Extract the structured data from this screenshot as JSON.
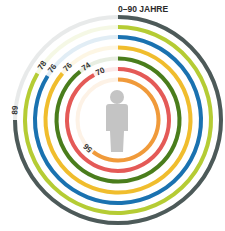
{
  "chart_data": {
    "type": "radial-bar",
    "title": "0–90 JAHRE",
    "range": [
      0,
      90
    ],
    "series": [
      {
        "name": "ring-1",
        "value": 89,
        "color": "#4d5a59"
      },
      {
        "name": "ring-2",
        "value": 78,
        "color": "#b5cc34"
      },
      {
        "name": "ring-3",
        "value": 76,
        "color": "#1a72b0"
      },
      {
        "name": "ring-4",
        "value": 76,
        "color": "#f0bd2d"
      },
      {
        "name": "ring-5",
        "value": 74,
        "color": "#4a7d1c"
      },
      {
        "name": "ring-6",
        "value": 70,
        "color": "#e45a57"
      },
      {
        "name": "ring-7",
        "value": 56,
        "color": "#f09a3a"
      }
    ],
    "center_icon": "person-icon"
  },
  "labels": {
    "title": "0–90 JAHRE",
    "v0": "89",
    "v1": "78",
    "v2": "76",
    "v3": "76",
    "v4": "74",
    "v5": "70",
    "v6": "56"
  }
}
